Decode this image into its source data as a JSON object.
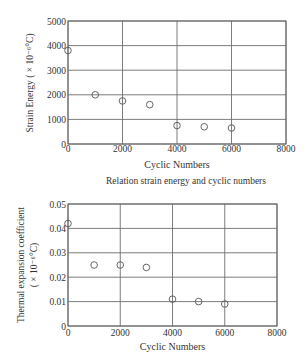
{
  "figure": {
    "caption_top": "Relation strain energy and cyclic numbers"
  },
  "colors": {
    "axis": "#666666",
    "grid": "#6e6e6e",
    "marker": "#555555",
    "text": "#333333"
  },
  "chart_data": [
    {
      "type": "scatter",
      "title": "",
      "xlabel": "Cyclic Numbers",
      "ylabel": "Strain Energy (×10⁻⁶°C)",
      "ylabel_lines": [
        "Strain Energy ( × 10⁻⁶°C)"
      ],
      "xlim": [
        0,
        8000
      ],
      "ylim": [
        0,
        5000
      ],
      "xticks": [
        0,
        2000,
        4000,
        6000,
        8000
      ],
      "yticks": [
        0,
        1000,
        2000,
        3000,
        4000,
        5000
      ],
      "xtick_labels": [
        "0",
        "2000",
        "4000",
        "6000",
        "8000"
      ],
      "ytick_labels": [
        "0",
        "1000",
        "2000",
        "3000",
        "4000",
        "5000"
      ],
      "grid": true,
      "marker": "open-circle",
      "series": [
        {
          "name": "Strain Energy",
          "x": [
            0,
            1000,
            2000,
            3000,
            4000,
            5000,
            6000
          ],
          "y": [
            3800,
            2000,
            1750,
            1600,
            750,
            700,
            650
          ]
        }
      ],
      "caption": "Relation strain energy and cyclic numbers"
    },
    {
      "type": "scatter",
      "title": "",
      "xlabel": "Cyclic Numbers",
      "ylabel": "Thermal expansion coefficient (×10⁻⁶°C)",
      "ylabel_lines": [
        "Thermal expansion coefficient",
        "( × 10⁻⁶°C)"
      ],
      "xlim": [
        0,
        8000
      ],
      "ylim": [
        0,
        0.05
      ],
      "xticks": [
        0,
        2000,
        4000,
        6000,
        8000
      ],
      "yticks": [
        0,
        0.01,
        0.02,
        0.03,
        0.04,
        0.05
      ],
      "xtick_labels": [
        "0",
        "2000",
        "4000",
        "6000",
        "8000"
      ],
      "ytick_labels": [
        "0",
        "0.01",
        "0.02",
        "0.03",
        "0.04",
        "0.05"
      ],
      "grid": true,
      "marker": "open-circle",
      "series": [
        {
          "name": "Thermal expansion coefficient",
          "x": [
            0,
            1000,
            2000,
            3000,
            4000,
            5000,
            6000
          ],
          "y": [
            0.042,
            0.025,
            0.025,
            0.024,
            0.011,
            0.01,
            0.009
          ]
        }
      ],
      "caption": ""
    }
  ]
}
